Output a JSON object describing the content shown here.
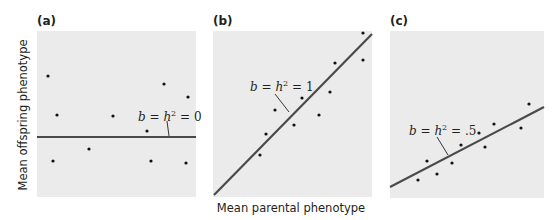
{
  "chart_data": [
    {
      "type": "scatter",
      "panel": "(a)",
      "title": "(a)",
      "annotation": "b = h2 = 0",
      "annotation_parts": {
        "b": "b",
        "eq1": " = ",
        "h": "h",
        "sup": "2",
        "eq2": " = ",
        "value": "0"
      },
      "slope": 0,
      "xlabel": "Mean parental phenotype",
      "ylabel": "Mean offspring phenotype",
      "grid": false,
      "points_px": [
        [
          48,
          76
        ],
        [
          57,
          115
        ],
        [
          53,
          161
        ],
        [
          89,
          149
        ],
        [
          113,
          116
        ],
        [
          147,
          131
        ],
        [
          164,
          84
        ],
        [
          151,
          161
        ],
        [
          188,
          97
        ],
        [
          186,
          163
        ]
      ],
      "regression_line_px": [
        [
          37,
          137
        ],
        [
          196,
          137
        ]
      ],
      "leader_px": [
        [
          167,
          121
        ],
        [
          169,
          136
        ]
      ],
      "annotation_pos_px": [
        138,
        121
      ]
    },
    {
      "type": "scatter",
      "panel": "(b)",
      "title": "(b)",
      "annotation": "b = h2 = 1",
      "annotation_parts": {
        "b": "b",
        "eq1": " = ",
        "h": "h",
        "sup": "2",
        "eq2": " = ",
        "value": "1"
      },
      "slope": 1,
      "xlabel": "Mean parental phenotype",
      "ylabel": "Mean offspring phenotype",
      "grid": false,
      "points_px": [
        [
          260,
          155
        ],
        [
          266,
          134
        ],
        [
          275,
          110
        ],
        [
          294,
          125
        ],
        [
          302,
          98
        ],
        [
          319,
          115
        ],
        [
          330,
          92
        ],
        [
          335,
          63
        ],
        [
          363,
          33
        ],
        [
          363,
          60
        ]
      ],
      "regression_line_px": [
        [
          214,
          195
        ],
        [
          372,
          34
        ]
      ],
      "leader_px": [
        [
          275,
          94
        ],
        [
          289,
          112
        ]
      ],
      "annotation_pos_px": [
        250,
        91
      ]
    },
    {
      "type": "scatter",
      "panel": "(c)",
      "title": "(c)",
      "annotation": "b = h2 = .5",
      "annotation_parts": {
        "b": "b",
        "eq1": " = ",
        "h": "h",
        "sup": "2",
        "eq2": " = ",
        "value": ".5"
      },
      "slope": 0.5,
      "xlabel": "Mean parental phenotype",
      "ylabel": "Mean offspring phenotype",
      "grid": false,
      "points_px": [
        [
          418,
          180
        ],
        [
          427,
          161
        ],
        [
          437,
          174
        ],
        [
          452,
          163
        ],
        [
          461,
          145
        ],
        [
          479,
          133
        ],
        [
          485,
          147
        ],
        [
          494,
          124
        ],
        [
          521,
          128
        ],
        [
          529,
          104
        ]
      ],
      "regression_line_px": [
        [
          390,
          187
        ],
        [
          544,
          107
        ]
      ],
      "leader_px": [
        [
          437,
          137
        ],
        [
          448,
          155
        ]
      ],
      "annotation_pos_px": [
        409,
        135
      ]
    }
  ],
  "figure": {
    "panel_labels": [
      "(a)",
      "(b)",
      "(c)"
    ],
    "xlabel": "Mean parental phenotype",
    "ylabel": "Mean offspring phenotype",
    "colors": {
      "panel_bg": "#ebebeb",
      "line": "#4a4a4a",
      "point": "#111111",
      "text": "#231f20"
    }
  }
}
